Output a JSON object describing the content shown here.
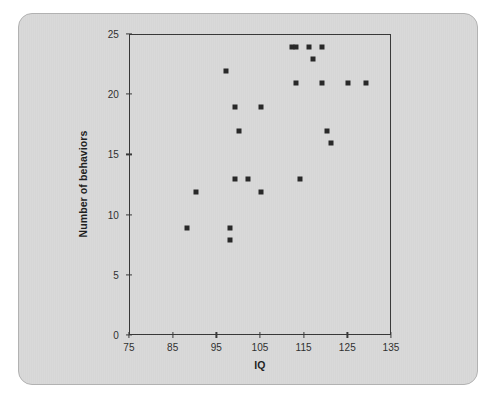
{
  "figure": {
    "background_color": "#d7d7d7",
    "page_color": "#ffffff",
    "border_color": "#b2b2b2",
    "axis_color": "#2c2c2c",
    "marker_color": "#1a1a1a"
  },
  "chart_data": {
    "type": "scatter",
    "title": "",
    "xlabel": "IQ",
    "ylabel": "Number of behaviors",
    "xlim": [
      75,
      135
    ],
    "ylim": [
      0,
      25
    ],
    "xticks": [
      75,
      85,
      95,
      105,
      115,
      125,
      135
    ],
    "yticks": [
      0,
      5,
      10,
      15,
      20,
      25
    ],
    "grid": false,
    "legend": null,
    "marker": "square",
    "points": [
      {
        "x": 88,
        "y": 9
      },
      {
        "x": 90,
        "y": 12
      },
      {
        "x": 97,
        "y": 22
      },
      {
        "x": 98,
        "y": 9
      },
      {
        "x": 98,
        "y": 8
      },
      {
        "x": 99,
        "y": 19
      },
      {
        "x": 99,
        "y": 13
      },
      {
        "x": 100,
        "y": 17
      },
      {
        "x": 102,
        "y": 13
      },
      {
        "x": 105,
        "y": 19
      },
      {
        "x": 105,
        "y": 12
      },
      {
        "x": 112,
        "y": 24
      },
      {
        "x": 113,
        "y": 24
      },
      {
        "x": 113,
        "y": 21
      },
      {
        "x": 114,
        "y": 13
      },
      {
        "x": 116,
        "y": 24
      },
      {
        "x": 117,
        "y": 23
      },
      {
        "x": 119,
        "y": 24
      },
      {
        "x": 119,
        "y": 21
      },
      {
        "x": 120,
        "y": 17
      },
      {
        "x": 121,
        "y": 16
      },
      {
        "x": 125,
        "y": 21
      },
      {
        "x": 129,
        "y": 21
      }
    ]
  }
}
